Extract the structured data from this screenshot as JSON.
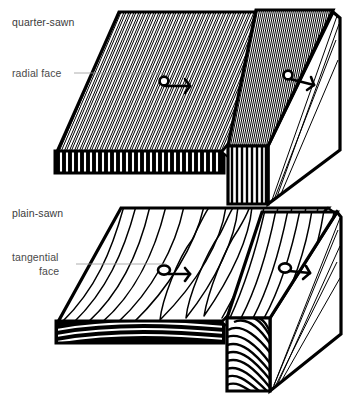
{
  "figure": {
    "background_color": "#ffffff",
    "ink_color": "#000000",
    "text_color": "#3b3b3b",
    "leader_color": "#9a9a9a",
    "width": 343,
    "height": 404
  },
  "labels": {
    "quarter_sawn": "quarter-sawn",
    "radial_face": "radial face",
    "plain_sawn": "plain-sawn",
    "tangential_line1": "tangential",
    "tangential_line2": "face"
  },
  "panels": [
    {
      "id": "quarter-sawn-board-flat",
      "name": "quarter-sawn-board-flat",
      "sawing_type": "quarter-sawn",
      "face_shown": "radial face",
      "grain_pattern": "straight parallel stripes",
      "end_grain_pattern": "vertical straight lines",
      "marker": "arrow-marker"
    },
    {
      "id": "quarter-sawn-board-edge",
      "name": "quarter-sawn-board-edge",
      "sawing_type": "quarter-sawn",
      "face_shown": "radial face",
      "grain_pattern": "straight parallel stripes",
      "end_grain_pattern": "vertical straight lines",
      "marker": "arrow-marker"
    },
    {
      "id": "plain-sawn-board-flat",
      "name": "plain-sawn-board-flat",
      "sawing_type": "plain-sawn",
      "face_shown": "tangential face",
      "grain_pattern": "cathedral arches",
      "end_grain_pattern": "curved arcs",
      "marker": "arrow-marker"
    },
    {
      "id": "plain-sawn-board-edge",
      "name": "plain-sawn-board-edge",
      "sawing_type": "plain-sawn",
      "face_shown": "tangential face",
      "grain_pattern": "long sweeping lines",
      "end_grain_pattern": "curved diagonal arcs",
      "marker": "arrow-marker"
    }
  ]
}
